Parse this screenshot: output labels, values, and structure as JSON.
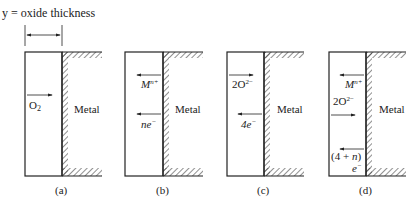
{
  "title": "y = oxide thickness",
  "metal_label": "Metal",
  "colors": {
    "line": "#222222",
    "background": "#ffffff"
  },
  "panels": [
    {
      "id": "a",
      "caption": "(a)",
      "arrows": [
        {
          "label": "O",
          "sub": "2",
          "direction": "right"
        }
      ]
    },
    {
      "id": "b",
      "caption": "(b)",
      "arrows": [
        {
          "label": "M",
          "sup": "n+",
          "direction": "left"
        },
        {
          "label": "ne",
          "sup": "−",
          "direction": "left"
        }
      ]
    },
    {
      "id": "c",
      "caption": "(c)",
      "arrows": [
        {
          "label": "2O",
          "sup": "2−",
          "direction": "right"
        },
        {
          "label": "4e",
          "sup": "−",
          "direction": "left"
        }
      ]
    },
    {
      "id": "d",
      "caption": "(d)",
      "arrows": [
        {
          "label": "M",
          "sup": "n+",
          "direction": "left"
        },
        {
          "label": "2O",
          "sup": "2−",
          "direction": "right"
        },
        {
          "label": "(4 + n)",
          "line2": "e",
          "sup": "−",
          "direction": "left"
        }
      ]
    }
  ]
}
